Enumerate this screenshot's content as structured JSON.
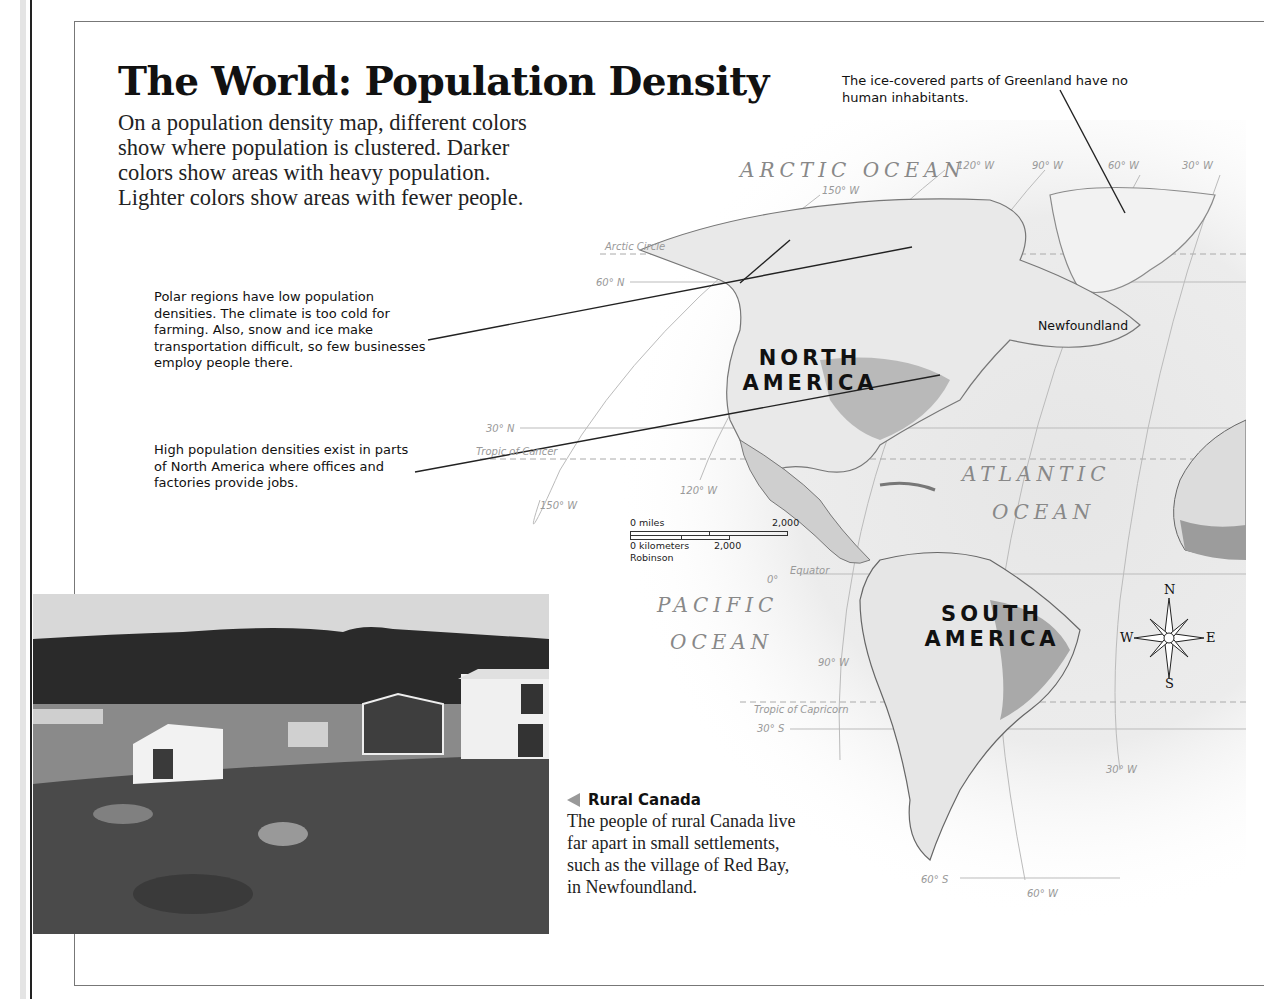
{
  "page": {
    "title": "The World: Population Density",
    "intro": "On a population density map, different colors show where population is clustered. Darker colors show areas with heavy population. Lighter colors show areas with fewer people."
  },
  "callouts": {
    "greenland": "The ice-covered parts of Greenland have no human inhabitants.",
    "polar": "Polar regions have low population densities. The climate is too cold for farming. Also, snow and ice make transportation difficult, so few businesses employ people there.",
    "north_america": "High population densities exist in parts of North America where offices and factories provide jobs."
  },
  "map": {
    "oceans": {
      "arctic": "ARCTIC OCEAN",
      "atlantic_1": "ATLANTIC",
      "atlantic_2": "OCEAN",
      "pacific_1": "PACIFIC",
      "pacific_2": "OCEAN"
    },
    "continents": {
      "north_america_1": "NORTH",
      "north_america_2": "AMERICA",
      "south_america_1": "SOUTH",
      "south_america_2": "AMERICA"
    },
    "places": {
      "newfoundland": "Newfoundland"
    },
    "grid_labels": {
      "lon_150w_top": "150° W",
      "lon_120w_top": "120° W",
      "lon_90w_top": "90° W",
      "lon_60w_top": "60° W",
      "lon_30w_top": "30° W",
      "arctic_circle": "Arctic Circle",
      "lat_60n": "60° N",
      "lat_30n": "30° N",
      "tropic_cancer": "Tropic of Cancer",
      "lon_150w": "150° W",
      "lon_120w": "120° W",
      "equator": "Equator",
      "lat_0": "0°",
      "lon_90w": "90° W",
      "tropic_capricorn": "Tropic of Capricorn",
      "lat_30s": "30° S",
      "lon_30w": "30° W",
      "lat_60s": "60° S",
      "lon_60w": "60° W"
    },
    "scale": {
      "miles_label": "0 miles",
      "miles_value": "2,000",
      "km_label": "0 kilometers",
      "km_value": "2,000",
      "projection": "Robinson"
    },
    "compass": {
      "n": "N",
      "s": "S",
      "e": "E",
      "w": "W"
    }
  },
  "photo_caption": {
    "heading": "Rural Canada",
    "body": "The people of rural Canada live far apart in small settlements, such as the village of Red Bay, in Newfoundland."
  }
}
